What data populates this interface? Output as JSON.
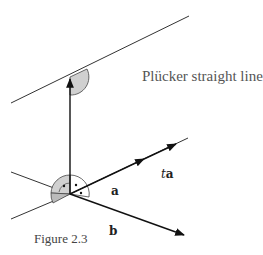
{
  "diagram": {
    "title": "Plücker straight line",
    "caption": "Figure 2.3",
    "labels": {
      "a": "a",
      "b": "b",
      "t": "t",
      "ta_vec": "a"
    },
    "colors": {
      "line": "#333333",
      "arrow": "#111111",
      "angle_fill": "#d0d0d0",
      "text": "#555555"
    }
  }
}
